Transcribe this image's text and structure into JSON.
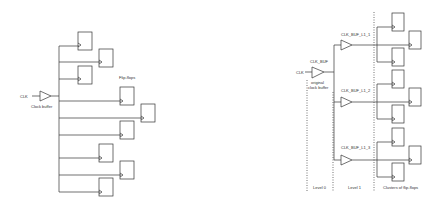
{
  "left_diagram": {
    "title": "Clock distribution without tree",
    "input_label": "CLK",
    "buffer_label": "Clock buffer",
    "ff_group_label": "Flip-flops",
    "flip_flop_count": 9
  },
  "right_diagram": {
    "title": "Clock tree",
    "input_label": "CLK",
    "root_buffer_label": "CLK_BUF",
    "root_buffer_caption_line1": "original",
    "root_buffer_caption_line2": "clock buffer",
    "level1_buffers": [
      {
        "label": "CLK_BUF_L1_1"
      },
      {
        "label": "CLK_BUF_L1_2"
      },
      {
        "label": "CLK_BUF_L1_3"
      }
    ],
    "level_labels": [
      "Level 0",
      "Level 1",
      "Clusters of flip-flops"
    ],
    "flip_flops_per_cluster": 3
  },
  "colors": {
    "line": "#333333",
    "background": "#ffffff"
  }
}
